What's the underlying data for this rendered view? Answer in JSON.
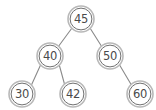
{
  "figure": {
    "kind": "binary-search-tree-diagram",
    "background_color": "#ffffff",
    "node_fill_color": "#ffffff",
    "node_stroke_color": "#6f6f6f",
    "edge_stroke_color": "#8a8a8a",
    "label_color": "#4a4a4a",
    "node_radius": 13
  },
  "chart_data": {
    "type": "diagram",
    "title": "",
    "nodes": [
      {
        "id": "n45",
        "label": "45",
        "x": 81,
        "y": 19,
        "level": 0,
        "role": "root"
      },
      {
        "id": "n40",
        "label": "40",
        "x": 50,
        "y": 56,
        "level": 1,
        "role": "left-child"
      },
      {
        "id": "n50",
        "label": "50",
        "x": 110,
        "y": 56,
        "level": 1,
        "role": "right-child"
      },
      {
        "id": "n30",
        "label": "30",
        "x": 22,
        "y": 94,
        "level": 2,
        "role": "left-leaf"
      },
      {
        "id": "n42",
        "label": "42",
        "x": 73,
        "y": 94,
        "level": 2,
        "role": "right-leaf"
      },
      {
        "id": "n60",
        "label": "60",
        "x": 140,
        "y": 94,
        "level": 2,
        "role": "right-leaf"
      }
    ],
    "edges": [
      {
        "from": "n45",
        "to": "n40",
        "x1": 72,
        "y1": 28,
        "x2": 58,
        "y2": 47
      },
      {
        "from": "n45",
        "to": "n50",
        "x1": 90,
        "y1": 28,
        "x2": 102,
        "y2": 47
      },
      {
        "from": "n40",
        "to": "n30",
        "x1": 41,
        "y1": 64,
        "x2": 31,
        "y2": 86
      },
      {
        "from": "n40",
        "to": "n42",
        "x1": 59,
        "y1": 64,
        "x2": 65,
        "y2": 86
      },
      {
        "from": "n50",
        "to": "n60",
        "x1": 119,
        "y1": 64,
        "x2": 132,
        "y2": 86
      }
    ]
  }
}
